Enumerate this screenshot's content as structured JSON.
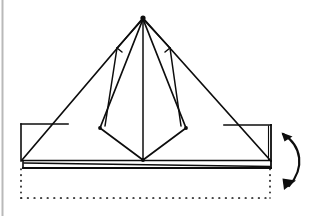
{
  "figure": {
    "kind": "origami-fold-diagram",
    "background_color": "#ffffff",
    "ink_color": "#0d0d0d",
    "scan_edge_color": "#b9b9b9",
    "canvas": {
      "width": 315,
      "height": 216
    }
  },
  "geometry": {
    "apex": {
      "x": 143,
      "y": 17
    },
    "base_left": {
      "x": 22,
      "y": 160
    },
    "base_right": {
      "x": 270,
      "y": 160
    },
    "base_y": 160,
    "strip_bottom_y": 168,
    "outer_triangle_points": "143,17 22,160 270,160",
    "inner_kite_points": "143,17 100,128 143,160 186,128",
    "kite_left_vertex": {
      "x": 100,
      "y": 128
    },
    "kite_right_vertex": {
      "x": 186,
      "y": 128
    },
    "kite_bottom_vertex": {
      "x": 143,
      "y": 160
    },
    "center_spine": {
      "x1": 143,
      "y1": 17,
      "x2": 143,
      "y2": 160
    },
    "notch_left": {
      "x": 117,
      "y": 48
    },
    "notch_right": {
      "x": 170,
      "y": 48
    },
    "left_flap_rect": {
      "x": 21,
      "y": 124,
      "w": 47,
      "h": 36
    },
    "right_flap_rect": {
      "x": 224,
      "y": 125,
      "w": 46,
      "h": 35
    },
    "bottom_strip": {
      "x": 24,
      "y": 160,
      "w": 246,
      "h": 8
    },
    "ghost_rect": {
      "x": 20,
      "y": 165,
      "w": 250,
      "h": 34
    },
    "arrow_path": "M 283 134 C 302 146 305 168 289 186",
    "arrow_head_top": "283,134 292,137 282,143",
    "arrow_head_bottom": "289,186 281,179 295,178"
  },
  "labels": {
    "figure_caption": "Fold the lower edge flap up behind the model.",
    "arrow_meaning": "fold-and-unfold / valley fold rotation",
    "ghost_meaning": "previous position of the flap (dotted)"
  },
  "elements": {
    "outer_triangle": "outer-triangle",
    "inner_kite": "inner-kite",
    "center_spine": "center-spine-crease",
    "left_flap": "left-flap-rectangle",
    "right_flap": "right-flap-rectangle",
    "bottom_strip": "bottom-folded-strip",
    "ghost_outline": "ghost-dotted-outline",
    "fold_arrow": "curved-fold-arrow"
  }
}
